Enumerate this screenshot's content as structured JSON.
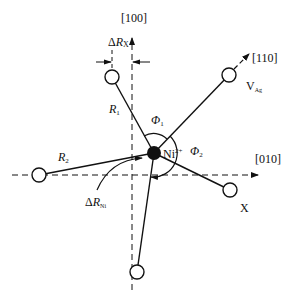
{
  "diagram": {
    "type": "crystal-defect-schematic",
    "axes": {
      "vertical": "[100]",
      "horizontal": "[010]",
      "diagonal": "[110]"
    },
    "center": {
      "label": "Ni",
      "superscript": "2+"
    },
    "labels": {
      "delta_rx": {
        "delta": "Δ",
        "symbol": "R",
        "sub": "X"
      },
      "delta_rni": {
        "delta": "Δ",
        "symbol": "R",
        "sub": "Ni"
      },
      "r1": {
        "symbol": "R",
        "sub": "1"
      },
      "r2": {
        "symbol": "R",
        "sub": "2"
      },
      "phi1": {
        "symbol": "Φ",
        "sub": "1"
      },
      "phi2": {
        "symbol": "Φ",
        "sub": "2"
      },
      "vacancy": {
        "symbol": "V",
        "sub": "Ag"
      },
      "x_site": "X"
    },
    "colors": {
      "line": "#111111",
      "background": "#ffffff"
    }
  }
}
